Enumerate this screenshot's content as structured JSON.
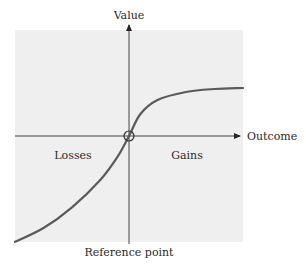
{
  "chart_data": {
    "type": "line",
    "title": "",
    "xlabel": "Outcome",
    "ylabel": "Value",
    "annotations": {
      "left_region": "Losses",
      "right_region": "Gains",
      "origin_label": "Reference point"
    },
    "grid": false,
    "legend": null,
    "series": [
      {
        "name": "Value function",
        "description": "S-shaped curve: concave for gains, convex and steeper for losses, passing through the reference point",
        "x": [
          -1.0,
          -0.75,
          -0.5,
          -0.25,
          -0.1,
          0,
          0.1,
          0.25,
          0.5,
          0.75,
          1.0
        ],
        "values": [
          -0.92,
          -0.8,
          -0.62,
          -0.38,
          -0.18,
          0,
          0.22,
          0.36,
          0.44,
          0.47,
          0.48
        ]
      }
    ],
    "xlim": [
      -1,
      1
    ],
    "ylim": [
      -1,
      1
    ]
  },
  "colors": {
    "background_panel": "#efefef",
    "axis": "#333333",
    "curve": "#5a5a5a"
  }
}
